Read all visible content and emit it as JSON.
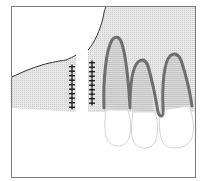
{
  "diagram": {
    "colors": {
      "background": "#ffffff",
      "frame": "#7a7a7a",
      "tissue_fill": "#e4e4e4",
      "tissue_hatch": "#d2d2d2",
      "root_outline": "#6e6e6e",
      "root_fill": "#d6d6d6",
      "gingival_edge": "#2e2e2e",
      "crown_outline": "#d8d8d8",
      "suture": "#1e1e1e"
    },
    "elements": {
      "left_flap": "gingival flap (left)",
      "right_tissue": "mucosa over teeth (right)",
      "suture_rows": 2,
      "stitches_per_row": 10,
      "teeth": 3
    }
  }
}
